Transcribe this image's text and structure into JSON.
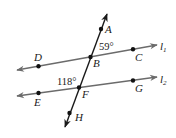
{
  "diagram": {
    "type": "parallel lines cut by a transversal",
    "lines": [
      {
        "id": "l1",
        "label": "l",
        "subscript": "1",
        "points": [
          "D",
          "B",
          "C"
        ]
      },
      {
        "id": "l2",
        "label": "l",
        "subscript": "2",
        "points": [
          "E",
          "F",
          "G"
        ]
      },
      {
        "id": "transversal",
        "points": [
          "A",
          "B",
          "F",
          "H"
        ]
      }
    ],
    "points": {
      "A": "A",
      "B": "B",
      "C": "C",
      "D": "D",
      "E": "E",
      "F": "F",
      "G": "G",
      "H": "H"
    },
    "angles": {
      "angle_ABC": "59°",
      "angle_EFB": "118°"
    },
    "colors": {
      "parallel_lines": "#6b6b6b",
      "transversal": "#1a1a1a",
      "points": "#111111"
    }
  }
}
